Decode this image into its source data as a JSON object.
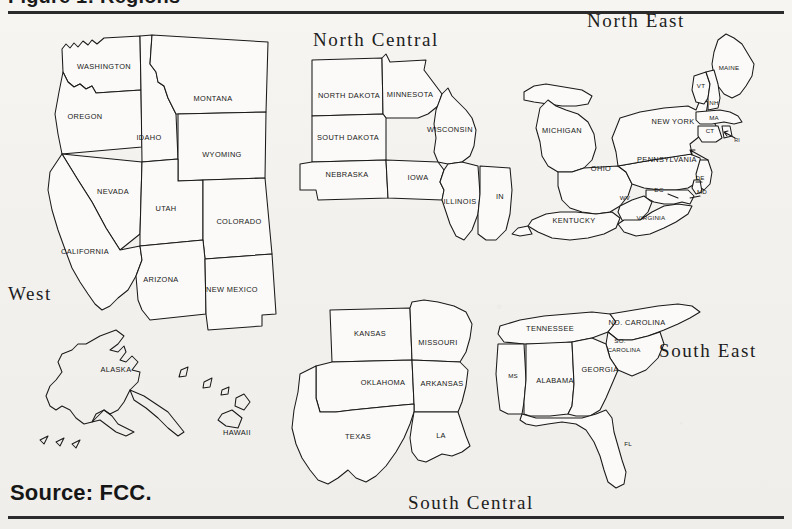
{
  "figure": {
    "title_cut": "Figure 1: Regions",
    "source": "Source: FCC.",
    "top_rule": true,
    "bottom_rule": true
  },
  "regions": [
    {
      "id": "west",
      "label": "West",
      "x": 8,
      "y": 283
    },
    {
      "id": "north-central",
      "label": "North Central",
      "x": 313,
      "y": 29
    },
    {
      "id": "north-east",
      "label": "North East",
      "x": 587,
      "y": 10
    },
    {
      "id": "south-central",
      "label": "South Central",
      "x": 408,
      "y": 492
    },
    {
      "id": "south-east",
      "label": "South East",
      "x": 659,
      "y": 340
    }
  ],
  "states": {
    "west": [
      {
        "code": "WA",
        "label": "WASHINGTON",
        "x": 104,
        "y": 55,
        "size": "md"
      },
      {
        "code": "OR",
        "label": "OREGON",
        "x": 85,
        "y": 105,
        "size": "md"
      },
      {
        "code": "ID",
        "label": "IDAHO",
        "x": 149,
        "y": 126,
        "size": "md"
      },
      {
        "code": "MT",
        "label": "MONTANA",
        "x": 213,
        "y": 87,
        "size": "md"
      },
      {
        "code": "WY",
        "label": "WYOMING",
        "x": 222,
        "y": 143,
        "size": "md"
      },
      {
        "code": "NV",
        "label": "NEVADA",
        "x": 113,
        "y": 180,
        "size": "md"
      },
      {
        "code": "UT",
        "label": "UTAH",
        "x": 166,
        "y": 197,
        "size": "md"
      },
      {
        "code": "CO",
        "label": "COLORADO",
        "x": 239,
        "y": 210,
        "size": "md"
      },
      {
        "code": "CA",
        "label": "CALIFORNIA",
        "x": 85,
        "y": 240,
        "size": "md"
      },
      {
        "code": "AZ",
        "label": "ARIZONA",
        "x": 161,
        "y": 268,
        "size": "md"
      },
      {
        "code": "NM",
        "label": "NEW MEXICO",
        "x": 232,
        "y": 278,
        "size": "md"
      },
      {
        "code": "AK",
        "label": "ALASKA",
        "x": 116,
        "y": 358,
        "size": "md"
      },
      {
        "code": "HI",
        "label": "HAWAII",
        "x": 237,
        "y": 421,
        "size": "md"
      }
    ],
    "north_central": [
      {
        "code": "ND",
        "label": "NORTH DAKOTA",
        "x": 349,
        "y": 84,
        "size": "md"
      },
      {
        "code": "MN",
        "label": "MINNESOTA",
        "x": 410,
        "y": 83,
        "size": "md"
      },
      {
        "code": "SD",
        "label": "SOUTH DAKOTA",
        "x": 348,
        "y": 126,
        "size": "md"
      },
      {
        "code": "WI",
        "label": "WISCONSIN",
        "x": 450,
        "y": 118,
        "size": "md"
      },
      {
        "code": "NE",
        "label": "NEBRASKA",
        "x": 347,
        "y": 163,
        "size": "md"
      },
      {
        "code": "IA",
        "label": "IOWA",
        "x": 418,
        "y": 166,
        "size": "md"
      },
      {
        "code": "IL",
        "label": "ILLINOIS",
        "x": 460,
        "y": 190,
        "size": "md"
      },
      {
        "code": "IN",
        "label": "IN",
        "x": 500,
        "y": 185,
        "size": "md"
      }
    ],
    "north_east": [
      {
        "code": "ME",
        "label": "MAINE",
        "x": 729,
        "y": 56,
        "size": "sm"
      },
      {
        "code": "VT",
        "label": "VT",
        "x": 701,
        "y": 74,
        "size": "sm"
      },
      {
        "code": "NH",
        "label": "NH",
        "x": 714,
        "y": 91,
        "size": "sm"
      },
      {
        "code": "MA",
        "label": "MA",
        "x": 714,
        "y": 106,
        "size": "sm"
      },
      {
        "code": "CT",
        "label": "CT",
        "x": 710,
        "y": 119,
        "size": "sm"
      },
      {
        "code": "RI",
        "label": "RI",
        "x": 737,
        "y": 128,
        "size": "xs"
      },
      {
        "code": "NY",
        "label": "NEW YORK",
        "x": 673,
        "y": 110,
        "size": "md"
      },
      {
        "code": "PA",
        "label": "PENNSYLVANIA",
        "x": 667,
        "y": 148,
        "size": "md"
      },
      {
        "code": "MI",
        "label": "MICHIGAN",
        "x": 562,
        "y": 119,
        "size": "md"
      },
      {
        "code": "OH",
        "label": "OHIO",
        "x": 601,
        "y": 157,
        "size": "md"
      },
      {
        "code": "WV",
        "label": "WV",
        "x": 625,
        "y": 186,
        "size": "sm"
      },
      {
        "code": "DC",
        "label": "DC",
        "x": 659,
        "y": 178,
        "size": "sm"
      },
      {
        "code": "DE",
        "label": "DE",
        "x": 700,
        "y": 166,
        "size": "sm"
      },
      {
        "code": "MD",
        "label": "MD",
        "x": 702,
        "y": 180,
        "size": "sm"
      },
      {
        "code": "VA",
        "label": "VIRGINIA",
        "x": 651,
        "y": 206,
        "size": "sm"
      },
      {
        "code": "KY",
        "label": "KENTUCKY",
        "x": 574,
        "y": 209,
        "size": "md"
      }
    ],
    "south_central": [
      {
        "code": "KS",
        "label": "KANSAS",
        "x": 370,
        "y": 322,
        "size": "md"
      },
      {
        "code": "MO",
        "label": "MISSOURI",
        "x": 438,
        "y": 331,
        "size": "md"
      },
      {
        "code": "OK",
        "label": "OKLAHOMA",
        "x": 383,
        "y": 371,
        "size": "md"
      },
      {
        "code": "AR",
        "label": "ARKANSAS",
        "x": 442,
        "y": 372,
        "size": "md"
      },
      {
        "code": "TX",
        "label": "TEXAS",
        "x": 358,
        "y": 425,
        "size": "md"
      },
      {
        "code": "LA",
        "label": "LA",
        "x": 441,
        "y": 424,
        "size": "md"
      }
    ],
    "south_east": [
      {
        "code": "TN",
        "label": "TENNESSEE",
        "x": 550,
        "y": 317,
        "size": "md"
      },
      {
        "code": "NC",
        "label": "NO. CAROLINA",
        "x": 637,
        "y": 311,
        "size": "md"
      },
      {
        "code": "SC",
        "label": "SO.",
        "x": 620,
        "y": 329,
        "size": "sm"
      },
      {
        "code": "SC2",
        "label": "CAROLINA",
        "x": 624,
        "y": 338,
        "size": "sm"
      },
      {
        "code": "MS",
        "label": "MS",
        "x": 513,
        "y": 364,
        "size": "sm"
      },
      {
        "code": "AL",
        "label": "ALABAMA",
        "x": 555,
        "y": 369,
        "size": "md"
      },
      {
        "code": "GA",
        "label": "GEORGIA",
        "x": 600,
        "y": 358,
        "size": "md"
      },
      {
        "code": "FL",
        "label": "FL",
        "x": 628,
        "y": 432,
        "size": "sm"
      }
    ]
  },
  "colors": {
    "background": "#f4f3f0",
    "ink": "#1a1a1a",
    "state_fill": "#fbfaf8"
  }
}
